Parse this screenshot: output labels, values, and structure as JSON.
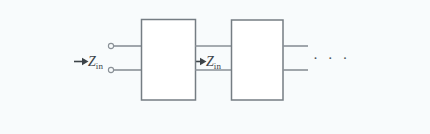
{
  "figure": {
    "background_color": "#f8fbfc",
    "line_color": "#7e868c",
    "box_border_color": "#6e767c",
    "box_fill_color": "#ffffff",
    "text_color": "#3c4348"
  },
  "labels": {
    "zin_left": {
      "symbol": "Z",
      "subscript": "in",
      "full": "Z_in"
    },
    "zin_mid": {
      "symbol": "Z",
      "subscript": "in",
      "full": "Z_in"
    },
    "ellipsis": "· · ·"
  },
  "arrows": {
    "left_arrow": "arrow-right",
    "mid_arrow": "arrow-right"
  },
  "terminals": {
    "top_terminal": "terminal-circle",
    "bottom_terminal": "terminal-circle",
    "count": 2
  },
  "blocks": [
    {
      "name": "network-block-1",
      "label": ""
    },
    {
      "name": "network-block-2",
      "label": ""
    }
  ],
  "geometry": {
    "top_line_y": 46,
    "bottom_line_y": 70,
    "block1": {
      "x": 141,
      "y": 19,
      "w": 54,
      "h": 81
    },
    "block2": {
      "x": 231,
      "y": 20,
      "w": 52,
      "h": 80
    },
    "terminal_x": 111,
    "right_line_end_x": 308
  }
}
